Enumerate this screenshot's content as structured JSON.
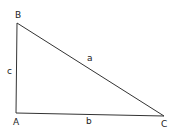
{
  "diagram": {
    "type": "right-triangle",
    "line_color": "#333333",
    "text_color": "#222222",
    "background": "#ffffff",
    "vertices": [
      {
        "id": "A",
        "label": "A",
        "x": 16,
        "y": 113,
        "label_x": 13,
        "label_y": 125
      },
      {
        "id": "B",
        "label": "B",
        "x": 17,
        "y": 23,
        "label_x": 15,
        "label_y": 18
      },
      {
        "id": "C",
        "label": "C",
        "x": 164,
        "y": 116,
        "label_x": 161,
        "label_y": 127
      }
    ],
    "sides": [
      {
        "id": "a",
        "label": "a",
        "from": "B",
        "to": "C",
        "label_x": 87,
        "label_y": 61
      },
      {
        "id": "b",
        "label": "b",
        "from": "A",
        "to": "C",
        "label_x": 86,
        "label_y": 124
      },
      {
        "id": "c",
        "label": "c",
        "from": "A",
        "to": "B",
        "label_x": 7,
        "label_y": 74
      }
    ]
  }
}
